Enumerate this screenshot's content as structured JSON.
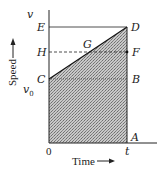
{
  "figure": {
    "type": "speed-time diagram",
    "axes": {
      "y_label": "Speed",
      "x_label": "Time",
      "y_top_label": "v",
      "y_v0_label": "v0",
      "x_origin_label": "0",
      "x_t_label": "t"
    },
    "points": {
      "E": "E",
      "H": "H",
      "C": "C",
      "D": "D",
      "F": "F",
      "B": "B",
      "G": "G",
      "A": "A"
    },
    "colors": {
      "line": "#222222",
      "hatch": "#9a9a9a",
      "background": "#ffffff"
    }
  }
}
